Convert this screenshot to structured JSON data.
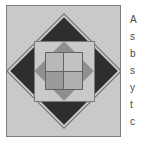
{
  "figure": {
    "panel": {
      "background_color": "#c9c9c9",
      "border_color": "#7d7d7d"
    },
    "layers": [
      {
        "name": "outlined-diamond",
        "shape": "square rotated 45 degrees",
        "fill": "none",
        "stroke_color": "#6e6e6e"
      },
      {
        "name": "dark-diamond",
        "shape": "square rotated 45 degrees",
        "fill": "#2e2e2e"
      },
      {
        "name": "light-square",
        "shape": "axis-aligned square",
        "fill": "#c9c9c9",
        "stroke_color": "#7a7a7a"
      },
      {
        "name": "mid-gray-diamond",
        "shape": "square rotated 45 degrees",
        "fill": "#8f8f8f"
      },
      {
        "name": "grid-square",
        "shape": "axis-aligned square divided into 2x2 cells",
        "stroke_color": "#636363"
      }
    ],
    "grid_cells": [
      {
        "position": "top-left",
        "fill": "#b8b8b8"
      },
      {
        "position": "top-right",
        "fill": "#c2c2c2"
      },
      {
        "position": "bottom-left",
        "fill": "#9a9a9a"
      },
      {
        "position": "bottom-right",
        "fill": "#b0b0b0"
      }
    ]
  },
  "side_text": {
    "lines": [
      "A",
      "s",
      "b",
      "s",
      "y",
      "t",
      "c"
    ]
  }
}
